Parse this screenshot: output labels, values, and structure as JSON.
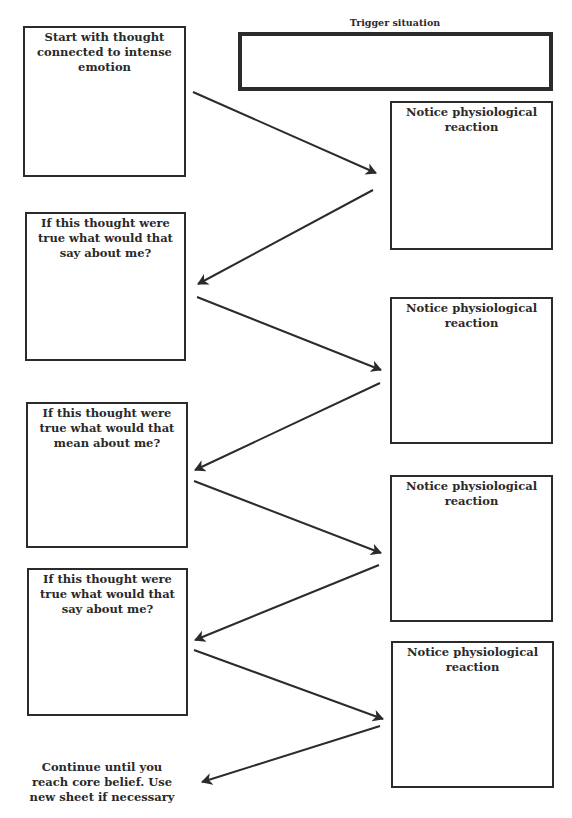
{
  "trigger": {
    "title": "Trigger situation",
    "value": ""
  },
  "left_boxes": [
    {
      "label": "Start with thought connected to intense emotion",
      "value": ""
    },
    {
      "label": "If this thought were true what would that say about me?",
      "value": ""
    },
    {
      "label": "If this thought were true what would that mean about me?",
      "value": ""
    },
    {
      "label": "If this thought were true what would that say about me?",
      "value": ""
    }
  ],
  "right_boxes": [
    {
      "label": "Notice physiological reaction",
      "value": ""
    },
    {
      "label": "Notice physiological reaction",
      "value": ""
    },
    {
      "label": "Notice physiological reaction",
      "value": ""
    },
    {
      "label": "Notice physiological reaction",
      "value": ""
    }
  ],
  "continue_note": "Continue until you reach core belief. Use new sheet if necessary",
  "colors": {
    "stroke": "#2b2b2b",
    "text": "#2a2a2a",
    "background": "#ffffff"
  }
}
